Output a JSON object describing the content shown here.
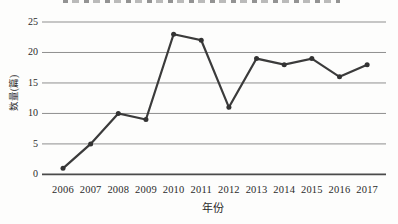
{
  "figure": {
    "x_axis_title": "年份",
    "y_axis_title": "数量(篇)"
  },
  "chart_data": {
    "type": "line",
    "title": "",
    "categories": [
      "2006",
      "2007",
      "2008",
      "2009",
      "2010",
      "2011",
      "2012",
      "2013",
      "2014",
      "2015",
      "2016",
      "2017"
    ],
    "values": [
      1,
      5,
      10,
      9,
      23,
      22,
      11,
      19,
      18,
      19,
      16,
      18
    ],
    "xlabel": "年份",
    "ylabel": "数量(篇)",
    "ylim": [
      0,
      25
    ],
    "yticks": [
      0,
      5,
      10,
      15,
      20,
      25
    ],
    "grid": "horizontal",
    "legend": "none",
    "marker": "circle",
    "colors": {
      "line": "#3b3b3b",
      "marker": "#333333",
      "gridline": "#8f8f8f",
      "axis_line": "#4a4a4a",
      "text": "#2b2b2b",
      "background": "#fdfdfc"
    }
  }
}
